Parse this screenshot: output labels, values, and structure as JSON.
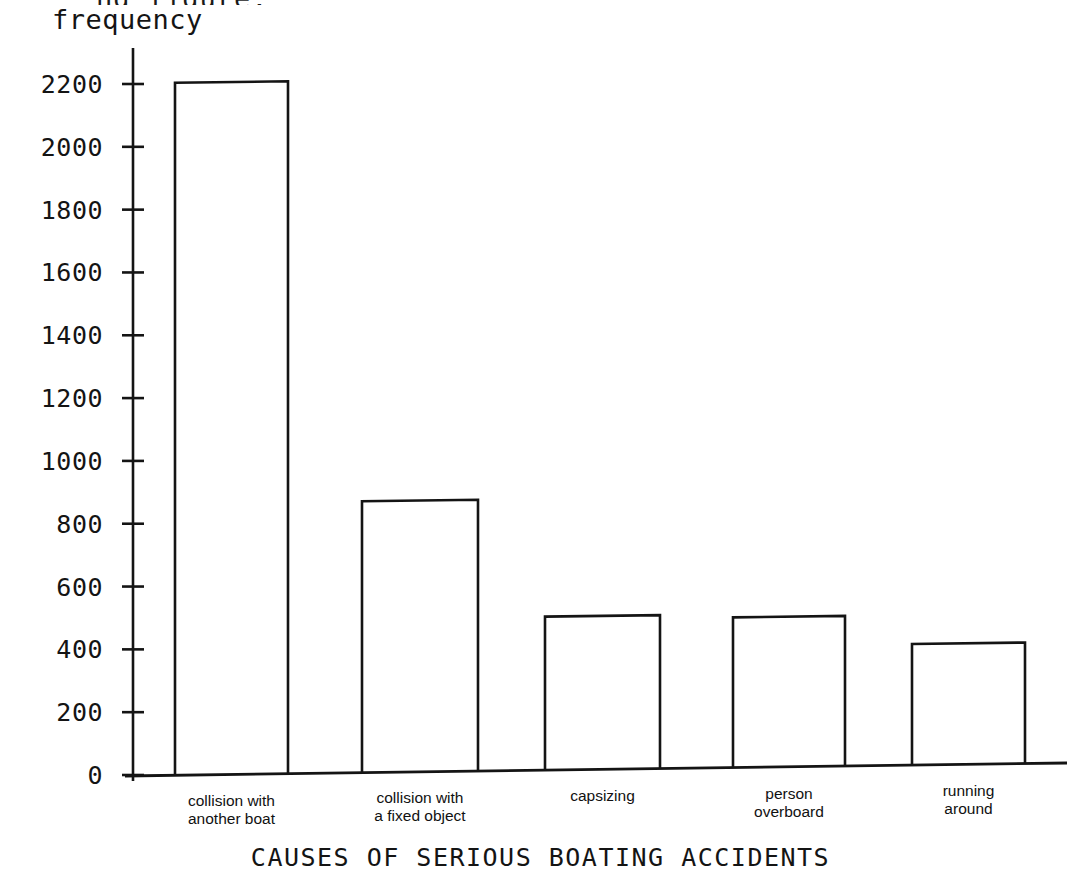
{
  "clipped_top_text": "ng figure.",
  "chart_data": {
    "type": "bar",
    "title": "CAUSES OF SERIOUS BOATING ACCIDENTS",
    "xlabel": "CAUSES OF SERIOUS BOATING ACCIDENTS",
    "ylabel": "frequency",
    "categories": [
      "collision with\nanother boat",
      "collision with\na fixed object",
      "capsizing",
      "person\noverboard",
      "running\naround"
    ],
    "category_lines": [
      [
        "collision with",
        "another boat"
      ],
      [
        "collision with",
        "a fixed object"
      ],
      [
        "capsizing",
        ""
      ],
      [
        "person",
        "overboard"
      ],
      [
        "running",
        "around"
      ]
    ],
    "values": [
      2200,
      860,
      485,
      475,
      383
    ],
    "ylim": [
      0,
      2300
    ],
    "ytick_labels": [
      "0",
      "200",
      "400",
      "600",
      "800",
      "1000",
      "1200",
      "1400",
      "1600",
      "1800",
      "2000",
      "2200"
    ],
    "ytick_values": [
      0,
      200,
      400,
      600,
      800,
      1000,
      1200,
      1400,
      1600,
      1800,
      2000,
      2200
    ],
    "grid": false,
    "legend": false,
    "bar_fill": "#ffffff",
    "bar_stroke": "#141414",
    "axis_color": "#141414"
  }
}
